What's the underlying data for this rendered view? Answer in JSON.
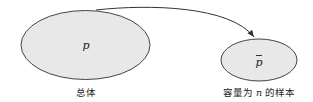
{
  "diagram": {
    "population": {
      "symbol": "p",
      "caption": "总体",
      "fill": "#e8e8e8",
      "stroke": "#444444"
    },
    "sample": {
      "symbol": "p",
      "symbol_accent": "bar",
      "caption_parts": [
        "容量为 ",
        "n",
        " 的样本"
      ],
      "fill": "#e8e8e8",
      "stroke": "#444444"
    },
    "arrow": {
      "from": "population",
      "to": "sample",
      "color": "#333333"
    }
  }
}
